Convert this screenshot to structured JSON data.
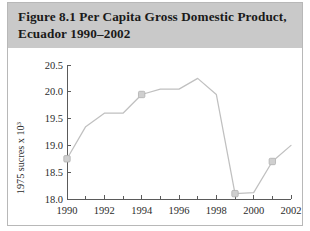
{
  "figure": {
    "title": "Figure 8.1  Per Capita Gross Domestic Product,\nEcuador 1990–2002",
    "band_color": "#c9c9c9",
    "panel_color": "#ffffff",
    "border_color": "#b8b8b8"
  },
  "chart_data": {
    "type": "line",
    "title": "Figure 8.1  Per Capita Gross Domestic Product, Ecuador 1990–2002",
    "xlabel": "",
    "ylabel": "1975 sucres x 10",
    "ylabel_superscript": "3",
    "x": [
      1990,
      1991,
      1992,
      1993,
      1994,
      1995,
      1996,
      1997,
      1998,
      1999,
      2000,
      2001,
      2002
    ],
    "values": [
      18.75,
      19.35,
      19.6,
      19.6,
      19.95,
      20.05,
      20.05,
      20.25,
      19.95,
      18.1,
      18.12,
      18.7,
      19.0
    ],
    "xlim": [
      1990,
      2002
    ],
    "ylim": [
      18.0,
      20.5
    ],
    "ytick_labels": [
      "20.5",
      "20.0",
      "19.5",
      "19.0",
      "18.5",
      "18.0"
    ],
    "ytick_values": [
      20.5,
      20.0,
      19.5,
      19.0,
      18.5,
      18.0
    ],
    "xtick_labels": [
      "1990",
      "1992",
      "1994",
      "1996",
      "1998",
      "2000",
      "2002"
    ],
    "xtick_values": [
      1990,
      1992,
      1994,
      1996,
      1998,
      2000,
      2002
    ],
    "xminor_ticks": [
      1991,
      1993,
      1995,
      1997,
      1999,
      2001
    ],
    "marker_points": [
      {
        "x": 1990,
        "y": 18.75
      },
      {
        "x": 1994,
        "y": 19.95
      },
      {
        "x": 1999,
        "y": 18.1
      },
      {
        "x": 2001,
        "y": 18.7
      }
    ],
    "grid": false,
    "legend": false,
    "line_color": "#c0c0c0",
    "marker_color": "#cfcfcf",
    "axis_color": "#5a5a5a"
  }
}
